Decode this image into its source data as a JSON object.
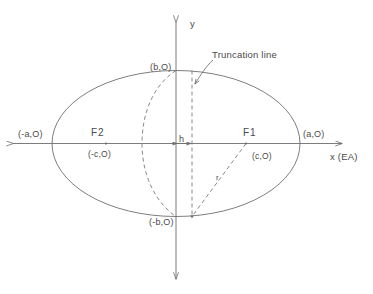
{
  "figure": {
    "type": "geometry-diagram",
    "axes": {
      "x_label": "x  (EA)",
      "y_label": "y"
    },
    "annotations": {
      "truncation_line": "Truncation line",
      "h_dimension": "h",
      "r_dimension": "r"
    },
    "points": {
      "left_vertex": "(-a,O)",
      "right_vertex": "(a,O)",
      "top_vertex": "(b,O)",
      "bottom_vertex": "(-b,O)",
      "focus_1_name": "F1",
      "focus_1_coord": "(c,O)",
      "focus_2_name": "F2",
      "focus_2_coord": "(-c,O)"
    },
    "colors": {
      "stroke": "#6e6e6e",
      "text": "#4a4a4a",
      "background": "#ffffff"
    }
  }
}
